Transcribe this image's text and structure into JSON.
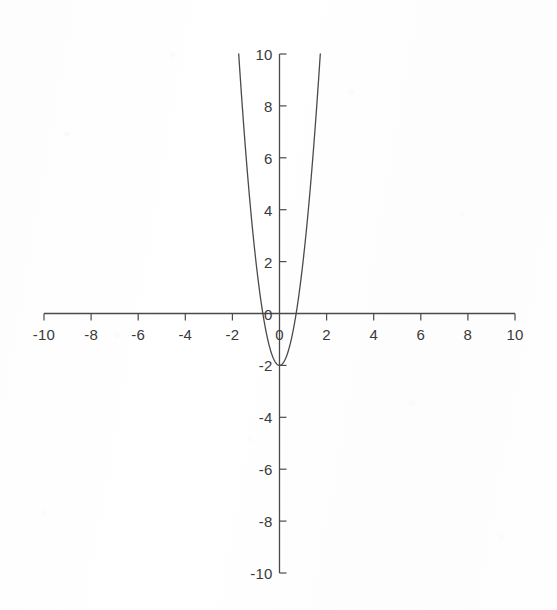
{
  "chart_data": {
    "type": "line",
    "title": "",
    "subtitle": "",
    "xlabel": "",
    "ylabel": "",
    "xlim": [
      -10,
      10
    ],
    "ylim": [
      -10,
      10
    ],
    "grid": false,
    "legend": null,
    "legend_position": "none",
    "x_ticks": [
      -10,
      -8,
      -6,
      -4,
      -2,
      0,
      2,
      4,
      6,
      8,
      10
    ],
    "x_tick_labels": [
      "-10",
      "-8",
      "-6",
      "-4",
      "-2",
      "0",
      "2",
      "4",
      "6",
      "8",
      "10"
    ],
    "y_ticks": [
      10,
      8,
      6,
      4,
      2,
      0,
      -2,
      -4,
      -6,
      -8,
      -10
    ],
    "y_tick_labels": [
      "10",
      "8",
      "6",
      "4",
      "2",
      "0",
      "-2",
      "-4",
      "-6",
      "-8",
      "-10"
    ],
    "series": [
      {
        "name": "parabola",
        "equation": "y = 4x^2 - 2",
        "color": "#4a4a4a",
        "vertex": [
          0,
          -2
        ],
        "x_intercepts": [
          -0.707,
          0.707
        ],
        "y_intercept": -2,
        "x": [
          -1.75,
          -1.6,
          -1.4,
          -1.2,
          -1.0,
          -0.8,
          -0.707,
          -0.6,
          -0.4,
          -0.2,
          0,
          0.2,
          0.4,
          0.6,
          0.707,
          0.8,
          1.0,
          1.2,
          1.4,
          1.6,
          1.75
        ],
        "y": [
          10.25,
          8.24,
          5.84,
          3.76,
          2.0,
          0.56,
          0,
          -0.56,
          -1.36,
          -1.84,
          -2.0,
          -1.84,
          -1.36,
          -0.56,
          0,
          0.56,
          2.0,
          3.76,
          5.84,
          8.24,
          10.25
        ]
      }
    ],
    "axis_color": "#4a4a4a",
    "background_color": "#fefefe",
    "axes": {
      "x_axis_name": "x-axis",
      "y_axis_name": "y-axis",
      "tick_direction_x": "below",
      "tick_direction_y": "right"
    }
  },
  "figure": {
    "origin_label": "0",
    "caption": ""
  }
}
